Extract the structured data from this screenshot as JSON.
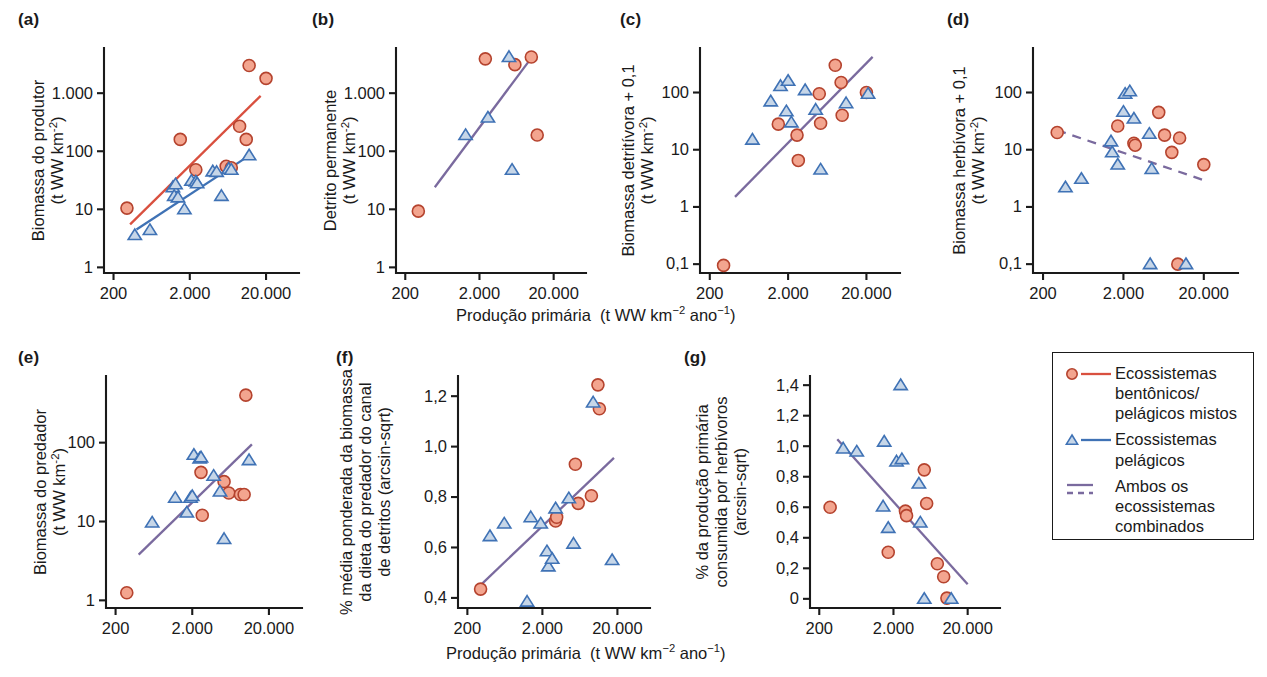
{
  "figure": {
    "xaxis_label_plain": "Produção primária  (t WW km⁻² ano⁻¹)",
    "panel_labels": [
      "(a)",
      "(b)",
      "(c)",
      "(d)",
      "(e)",
      "(f)",
      "(g)"
    ]
  },
  "legend": {
    "items": [
      {
        "symbol": "circle",
        "line": "solid-red",
        "label": "Ecossistemas bentônicos/ pelágicos mistos"
      },
      {
        "symbol": "triangle",
        "line": "solid-blue",
        "label": "Ecossistemas pelágicos"
      },
      {
        "symbol": "none",
        "line": "solid-and-dashed-purple",
        "label": "Ambos os ecossistemas combinados"
      }
    ],
    "colors": {
      "circle_fill": "#f3a58f",
      "circle_stroke": "#b5432e",
      "triangle_fill": "#c6d6e8",
      "triangle_stroke": "#3f72b5",
      "red_line": "#d9503f",
      "blue_line": "#3f72b5",
      "purple_line": "#7a6a9e"
    }
  },
  "chart_data": [
    {
      "id": "a",
      "type": "scatter",
      "label": "(a)",
      "title": "",
      "ylabel": "Biomassa do produtor (t WW km⁻²)",
      "xlabel": "Produção primária  (t WW km⁻² ano⁻¹)",
      "xscale": "log",
      "yscale": "log",
      "xticks": [
        200,
        2000,
        20000
      ],
      "xticklabels": [
        "200",
        "2.000",
        "20.000"
      ],
      "yticks": [
        1,
        10,
        100,
        1000
      ],
      "yticklabels": [
        "1",
        "10",
        "100",
        "1.000"
      ],
      "xlim": [
        150,
        40000
      ],
      "ylim": [
        0.8,
        6000
      ],
      "series": [
        {
          "name": "Ecossistemas bentônicos/pelágicos mistos",
          "marker": "circle",
          "points": [
            [
              300,
              10.5
            ],
            [
              1500,
              160
            ],
            [
              2400,
              48
            ],
            [
              6000,
              55
            ],
            [
              7000,
              52
            ],
            [
              9000,
              270
            ],
            [
              11000,
              160
            ],
            [
              12000,
              3000
            ],
            [
              20000,
              1800
            ]
          ]
        },
        {
          "name": "Ecossistemas pelágicos",
          "marker": "triangle",
          "points": [
            [
              380,
              3.6
            ],
            [
              600,
              4.4
            ],
            [
              1200,
              24
            ],
            [
              1250,
              17
            ],
            [
              1400,
              16
            ],
            [
              1300,
              27
            ],
            [
              1700,
              10
            ],
            [
              2100,
              31
            ],
            [
              2400,
              30
            ],
            [
              2500,
              28
            ],
            [
              4000,
              45
            ],
            [
              4500,
              44
            ],
            [
              5200,
              17
            ],
            [
              6500,
              50
            ],
            [
              7000,
              48
            ],
            [
              12000,
              85
            ]
          ]
        }
      ],
      "trendlines": [
        {
          "name": "benthic-pelagic-mixed",
          "style": "solid-red",
          "x": [
            330,
            17000
          ],
          "y": [
            5.5,
            900
          ]
        },
        {
          "name": "pelagic",
          "style": "solid-blue",
          "x": [
            400,
            13000
          ],
          "y": [
            4.5,
            90
          ]
        }
      ]
    },
    {
      "id": "b",
      "type": "scatter",
      "label": "(b)",
      "ylabel": "Detrito permanente (t WW km⁻²)",
      "xlabel": "Produção primária  (t WW km⁻² ano⁻¹)",
      "xscale": "log",
      "yscale": "log",
      "xticks": [
        200,
        2000,
        20000
      ],
      "xticklabels": [
        "200",
        "2.000",
        "20.000"
      ],
      "yticks": [
        1,
        10,
        100,
        1000
      ],
      "yticklabels": [
        "1",
        "10",
        "100",
        "1.000"
      ],
      "xlim": [
        150,
        40000
      ],
      "ylim": [
        0.8,
        6000
      ],
      "series": [
        {
          "name": "Ecossistemas bentônicos/pelágicos mistos",
          "marker": "circle",
          "points": [
            [
              300,
              9.3
            ],
            [
              2400,
              3900
            ],
            [
              6000,
              3100
            ],
            [
              10000,
              4200
            ],
            [
              12000,
              190
            ]
          ]
        },
        {
          "name": "Ecossistemas pelágicos",
          "marker": "triangle",
          "points": [
            [
              1300,
              190
            ],
            [
              2600,
              380
            ],
            [
              5000,
              4200
            ],
            [
              5500,
              48
            ]
          ]
        }
      ],
      "trendlines": [
        {
          "name": "both-combined",
          "style": "solid-purple",
          "x": [
            500,
            10500
          ],
          "y": [
            24,
            4400
          ]
        }
      ]
    },
    {
      "id": "c",
      "type": "scatter",
      "label": "(c)",
      "ylabel": "Biomassa detritívora + 0,1 (t WW km⁻²)",
      "xlabel": "Produção primária  (t WW km⁻² ano⁻¹)",
      "xscale": "log",
      "yscale": "log",
      "xticks": [
        200,
        2000,
        20000
      ],
      "xticklabels": [
        "200",
        "2.000",
        "20.000"
      ],
      "yticks": [
        0.1,
        1,
        10,
        100
      ],
      "yticklabels": [
        "0,1",
        "1",
        "10",
        "100"
      ],
      "xlim": [
        150,
        40000
      ],
      "ylim": [
        0.07,
        600
      ],
      "series": [
        {
          "name": "Ecossistemas bentônicos/pelágicos mistos",
          "marker": "circle",
          "points": [
            [
              300,
              0.095
            ],
            [
              1500,
              28
            ],
            [
              2600,
              18
            ],
            [
              2700,
              6.5
            ],
            [
              5000,
              95
            ],
            [
              5200,
              29
            ],
            [
              8000,
              300
            ],
            [
              9500,
              150
            ],
            [
              9800,
              40
            ],
            [
              20000,
              100
            ]
          ]
        },
        {
          "name": "Ecossistemas pelágicos",
          "marker": "triangle",
          "points": [
            [
              700,
              15
            ],
            [
              1200,
              70
            ],
            [
              1600,
              130
            ],
            [
              2000,
              160
            ],
            [
              1900,
              47
            ],
            [
              2200,
              30
            ],
            [
              3300,
              110
            ],
            [
              4500,
              50
            ],
            [
              5200,
              4.5
            ],
            [
              11000,
              65
            ],
            [
              21000,
              95
            ]
          ]
        }
      ],
      "trendlines": [
        {
          "name": "both-combined",
          "style": "solid-purple",
          "x": [
            420,
            24000
          ],
          "y": [
            1.5,
            420
          ]
        }
      ]
    },
    {
      "id": "d",
      "type": "scatter",
      "label": "(d)",
      "ylabel": "Biomassa herbívora + 0,1 (t WW km⁻²)",
      "xlabel": "Produção primária  (t WW km⁻² ano⁻¹)",
      "xscale": "log",
      "yscale": "log",
      "xticks": [
        200,
        2000,
        20000
      ],
      "xticklabels": [
        "200",
        "2.000",
        "20.000"
      ],
      "yticks": [
        0.1,
        1,
        10,
        100
      ],
      "yticklabels": [
        "0,1",
        "1",
        "10",
        "100"
      ],
      "xlim": [
        150,
        40000
      ],
      "ylim": [
        0.07,
        600
      ],
      "series": [
        {
          "name": "Ecossistemas bentônicos/pelágicos mistos",
          "marker": "circle",
          "points": [
            [
              300,
              20
            ],
            [
              1700,
              26
            ],
            [
              2700,
              13
            ],
            [
              2800,
              12
            ],
            [
              5500,
              45
            ],
            [
              6500,
              18
            ],
            [
              8000,
              9
            ],
            [
              10000,
              16
            ],
            [
              9500,
              0.1
            ],
            [
              20000,
              5.5
            ]
          ]
        },
        {
          "name": "Ecossistemas pelágicos",
          "marker": "triangle",
          "points": [
            [
              380,
              2.2
            ],
            [
              600,
              3.1
            ],
            [
              1400,
              14
            ],
            [
              1450,
              9
            ],
            [
              1700,
              5.5
            ],
            [
              2000,
              46
            ],
            [
              2100,
              95
            ],
            [
              2400,
              105
            ],
            [
              2700,
              35
            ],
            [
              4200,
              19
            ],
            [
              4500,
              4.6
            ],
            [
              4300,
              0.1
            ],
            [
              12000,
              0.1
            ]
          ]
        }
      ],
      "trendlines": [
        {
          "name": "both-combined",
          "style": "dashed-purple",
          "x": [
            300,
            22000
          ],
          "y": [
            22,
            2.8
          ]
        }
      ]
    },
    {
      "id": "e",
      "type": "scatter",
      "label": "(e)",
      "ylabel": "Biomassa do predador (t WW km⁻²)",
      "xlabel": "Produção primária  (t WW km⁻² ano⁻¹)",
      "xscale": "log",
      "yscale": "log",
      "xticks": [
        200,
        2000,
        20000
      ],
      "xticklabels": [
        "200",
        "2.000",
        "20.000"
      ],
      "yticks": [
        1,
        10,
        100
      ],
      "yticklabels": [
        "1",
        "10",
        "100"
      ],
      "xlim": [
        150,
        40000
      ],
      "ylim": [
        0.8,
        700
      ],
      "series": [
        {
          "name": "Ecossistemas bentônicos/pelágicos mistos",
          "marker": "circle",
          "points": [
            [
              280,
              1.25
            ],
            [
              2600,
              42
            ],
            [
              2700,
              12
            ],
            [
              5200,
              32
            ],
            [
              6000,
              23
            ],
            [
              8500,
              22
            ],
            [
              9500,
              22
            ],
            [
              10000,
              400
            ]
          ]
        },
        {
          "name": "Ecossistemas pelágicos",
          "marker": "triangle",
          "points": [
            [
              600,
              9.7
            ],
            [
              1200,
              20
            ],
            [
              1700,
              13
            ],
            [
              1900,
              20
            ],
            [
              2000,
              21
            ],
            [
              2100,
              70
            ],
            [
              2500,
              63
            ],
            [
              2600,
              65
            ],
            [
              3800,
              38
            ],
            [
              4600,
              24
            ],
            [
              5200,
              6
            ],
            [
              11000,
              60
            ]
          ]
        }
      ],
      "trendlines": [
        {
          "name": "both-combined",
          "style": "solid-purple",
          "x": [
            400,
            12000
          ],
          "y": [
            3.8,
            95
          ]
        }
      ]
    },
    {
      "id": "f",
      "type": "scatter",
      "label": "(f)",
      "ylabel": "% média ponderada da biomassa da dieta do predador do canal de detritos (arcsin-sqrt)",
      "xlabel": "Produção primária  (t WW km⁻² ano⁻¹)",
      "xscale": "log",
      "yscale": "linear",
      "xticks": [
        200,
        2000,
        20000
      ],
      "xticklabels": [
        "200",
        "2.000",
        "20.000"
      ],
      "yticks": [
        0.4,
        0.6,
        0.8,
        1.0,
        1.2
      ],
      "yticklabels": [
        "0,4",
        "0,6",
        "0,8",
        "1,0",
        "1,2"
      ],
      "xlim": [
        150,
        40000
      ],
      "ylim": [
        0.36,
        1.28
      ],
      "series": [
        {
          "name": "Ecossistemas bentônicos/pelágicos mistos",
          "marker": "circle",
          "points": [
            [
              300,
              0.435
            ],
            [
              3000,
              0.705
            ],
            [
              3100,
              0.72
            ],
            [
              5500,
              0.93
            ],
            [
              6000,
              0.775
            ],
            [
              9000,
              0.805
            ],
            [
              11000,
              1.245
            ],
            [
              11500,
              1.15
            ]
          ]
        },
        {
          "name": "Ecossistemas pelágicos",
          "marker": "triangle",
          "points": [
            [
              400,
              0.645
            ],
            [
              620,
              0.695
            ],
            [
              1250,
              0.385
            ],
            [
              1400,
              0.72
            ],
            [
              1900,
              0.695
            ],
            [
              2300,
              0.585
            ],
            [
              2400,
              0.525
            ],
            [
              2700,
              0.555
            ],
            [
              3000,
              0.755
            ],
            [
              4500,
              0.795
            ],
            [
              5200,
              0.615
            ],
            [
              9500,
              1.175
            ],
            [
              17000,
              0.55
            ]
          ]
        }
      ],
      "trendlines": [
        {
          "name": "both-combined",
          "style": "solid-purple",
          "x": [
            310,
            18000
          ],
          "y": [
            0.455,
            0.955
          ]
        }
      ]
    },
    {
      "id": "g",
      "type": "scatter",
      "label": "(g)",
      "ylabel": "% da produção primária consumida por herbívoros (arcsin-sqrt)",
      "xlabel": "Produção primária  (t WW km⁻² ano⁻¹)",
      "xscale": "log",
      "yscale": "linear",
      "xticks": [
        200,
        2000,
        20000
      ],
      "xticklabels": [
        "200",
        "2.000",
        "20.000"
      ],
      "yticks": [
        0,
        0.2,
        0.4,
        0.6,
        0.8,
        1.0,
        1.2,
        1.4
      ],
      "yticklabels": [
        "0",
        "0,2",
        "0,4",
        "0,6",
        "0,8",
        "1,0",
        "1,2",
        "1,4"
      ],
      "xlim": [
        150,
        40000
      ],
      "ylim": [
        -0.06,
        1.46
      ],
      "series": [
        {
          "name": "Ecossistemas bentônicos/pelágicos mistos",
          "marker": "circle",
          "points": [
            [
              280,
              0.6
            ],
            [
              1700,
              0.305
            ],
            [
              2900,
              0.575
            ],
            [
              3000,
              0.545
            ],
            [
              5200,
              0.845
            ],
            [
              5600,
              0.625
            ],
            [
              7800,
              0.23
            ],
            [
              9500,
              0.145
            ],
            [
              10500,
              0.005
            ]
          ]
        },
        {
          "name": "Ecossistemas pelágicos",
          "marker": "triangle",
          "points": [
            [
              420,
              0.985
            ],
            [
              640,
              0.965
            ],
            [
              1500,
              1.03
            ],
            [
              1450,
              0.605
            ],
            [
              1700,
              0.465
            ],
            [
              2200,
              0.9
            ],
            [
              2600,
              0.915
            ],
            [
              2500,
              1.4
            ],
            [
              4400,
              0.755
            ],
            [
              4600,
              0.5
            ],
            [
              5200,
              0.0
            ],
            [
              12000,
              0.0
            ]
          ]
        }
      ],
      "trendlines": [
        {
          "name": "both-combined",
          "style": "solid-purple",
          "x": [
            350,
            20000
          ],
          "y": [
            1.045,
            0.095
          ]
        }
      ]
    }
  ]
}
